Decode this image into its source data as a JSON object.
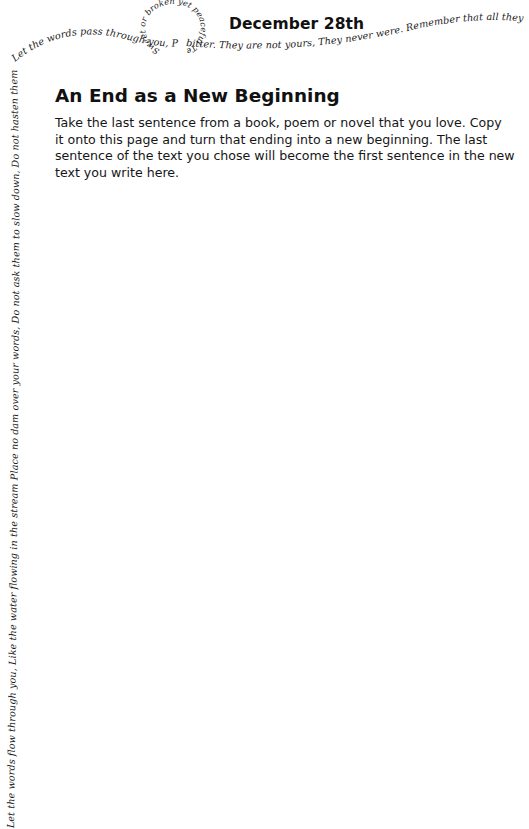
{
  "page": {
    "date": "December 28th",
    "prompt": {
      "title": "An End as a New Beginning",
      "lines": [
        "Take the last sentence from a book, poem or novel that you love. Copy",
        "it onto this page and turn that ending into a new beginning. The last",
        "sentence of the text you chose will become the first sentence in the new",
        "text you write here."
      ]
    }
  },
  "border_script": {
    "left_edge": "Let the words flow through you, Like the water flowing in the stream Place no dam over your words, Do not ask them to slow down, Do not hasten them forward Allow them to move freely As they are,",
    "top_curve": "Let the words pass through you, Peaceful and pleasant",
    "loop": "Sweet or broken yet peaceful Tender",
    "top_right": "bitter. They are not yours, They never were. Remember that all they want Is to reach their"
  }
}
